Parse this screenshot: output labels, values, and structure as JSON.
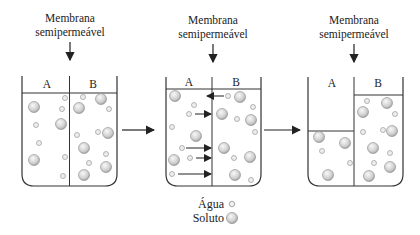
{
  "diagram": {
    "membrane_label_line1": "Membrana",
    "membrane_label_line2": "semipermeável",
    "compartment_a": "A",
    "compartment_b": "B",
    "stages": [
      {
        "id": "initial",
        "label_a": "A",
        "label_b": "B",
        "level_a": "equal",
        "level_b": "equal"
      },
      {
        "id": "flow",
        "label_a": "A",
        "label_b": "B",
        "water_flow": "A to B (4 arrows), B to A (1 arrow)"
      },
      {
        "id": "final",
        "label_a": "A",
        "label_b": "B",
        "level_a": "low",
        "level_b": "high"
      }
    ],
    "legend": {
      "water_label": "Água",
      "solute_label": "Soluto"
    },
    "colors": {
      "line": "#333333",
      "particle_fill": "#d8d8d8",
      "particle_stroke": "#888888"
    }
  }
}
